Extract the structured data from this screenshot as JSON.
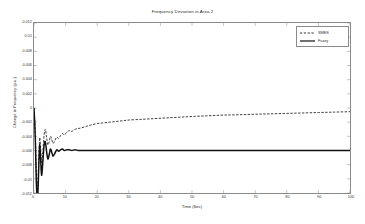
{
  "chart_data": {
    "type": "line",
    "title": "Frequency Deviation in Area 2",
    "xlabel": "Time (Sec)",
    "ylabel": "Change in Frequency (p.u.)",
    "xlim": [
      0,
      100
    ],
    "ylim": [
      -0.012,
      0.012
    ],
    "xticks": [
      0,
      10,
      20,
      30,
      40,
      50,
      60,
      70,
      80,
      90,
      100
    ],
    "xtick_labels": [
      "0",
      "10",
      "20",
      "30",
      "40",
      "50",
      "60",
      "70",
      "80",
      "90",
      "100"
    ],
    "yticks": [
      0.012,
      0.01,
      0.008,
      0.006,
      0.004,
      0.002,
      0,
      -0.002,
      -0.004,
      -0.006,
      -0.008,
      -0.01,
      -0.012
    ],
    "ytick_labels": [
      "0.012",
      "0.01",
      "0.008",
      "0.006",
      "0.004",
      "0.002",
      "0",
      "-0.002",
      "-0.004",
      "-0.006",
      "-0.008",
      "-0.01",
      "-0.012"
    ],
    "grid": false,
    "legend_position": "top-right",
    "series": [
      {
        "name": "SMES",
        "style": "dashed",
        "color": "#1a1a1a",
        "x": [
          0,
          0.4,
          0.8,
          1.2,
          1.5,
          1.8,
          2.1,
          2.4,
          2.8,
          3.2,
          3.6,
          4.0,
          4.4,
          4.8,
          5.2,
          5.6,
          6.0,
          6.6,
          7.2,
          7.8,
          8.4,
          9.0,
          9.6,
          10.4,
          11.2,
          12.0,
          13.0,
          14.0,
          15.0,
          16.5,
          18.0,
          20.0,
          22.0,
          24.0,
          26.0,
          28.0,
          30.0,
          34.0,
          38.0,
          42.0,
          46.0,
          50.0,
          55.0,
          60.0,
          65.0,
          70.0,
          75.0,
          80.0,
          85.0,
          90.0,
          95.0,
          100.0
        ],
        "y": [
          0.0,
          -0.0032,
          -0.0098,
          -0.0108,
          -0.0072,
          -0.0042,
          -0.0056,
          -0.0078,
          -0.0062,
          -0.0038,
          -0.003,
          -0.0042,
          -0.0052,
          -0.0048,
          -0.004,
          -0.0044,
          -0.005,
          -0.0046,
          -0.0041,
          -0.0043,
          -0.0039,
          -0.0036,
          -0.0038,
          -0.0034,
          -0.0032,
          -0.0033,
          -0.003,
          -0.0029,
          -0.0028,
          -0.0026,
          -0.0024,
          -0.0022,
          -0.0021,
          -0.002,
          -0.0019,
          -0.0018,
          -0.0017,
          -0.0016,
          -0.0015,
          -0.0014,
          -0.0013,
          -0.0012,
          -0.0011,
          -0.001,
          -0.00095,
          -0.00088,
          -0.00082,
          -0.00076,
          -0.0007,
          -0.00064,
          -0.00058,
          -0.00052
        ]
      },
      {
        "name": "Fuzzy",
        "style": "solid",
        "color": "#111111",
        "x": [
          0,
          0.4,
          0.8,
          1.2,
          1.5,
          1.8,
          2.1,
          2.4,
          2.8,
          3.2,
          3.6,
          4.0,
          4.4,
          4.8,
          5.2,
          5.6,
          6.0,
          6.6,
          7.2,
          7.8,
          8.4,
          9.0,
          9.6,
          10.4,
          11.2,
          12.0,
          13.0,
          14.0,
          15.0,
          16.5,
          18.0,
          20.0,
          24.0,
          28.0,
          34.0,
          40.0,
          50.0,
          60.0,
          70.0,
          80.0,
          90.0,
          100.0
        ],
        "y": [
          0.0,
          -0.0042,
          -0.0112,
          -0.0121,
          -0.0085,
          -0.0052,
          -0.0072,
          -0.0095,
          -0.0076,
          -0.0052,
          -0.0048,
          -0.0062,
          -0.0072,
          -0.0066,
          -0.0058,
          -0.0062,
          -0.0068,
          -0.0064,
          -0.0059,
          -0.0061,
          -0.0059,
          -0.0058,
          -0.006,
          -0.0059,
          -0.0059,
          -0.006,
          -0.0059,
          -0.006,
          -0.006,
          -0.006,
          -0.006,
          -0.006,
          -0.006,
          -0.006,
          -0.006,
          -0.006,
          -0.006,
          -0.006,
          -0.006,
          -0.006,
          -0.006,
          -0.006
        ]
      }
    ]
  },
  "legend": {
    "items": [
      {
        "label": "SMES",
        "style": "dashed"
      },
      {
        "label": "Fuzzy",
        "style": "solid"
      }
    ]
  }
}
